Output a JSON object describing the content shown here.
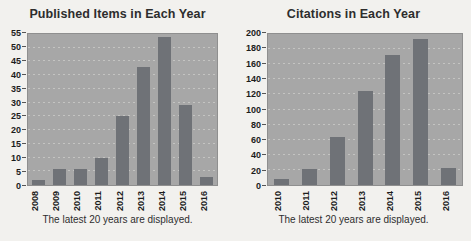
{
  "page": {
    "background_color": "#f2f1ee"
  },
  "chart_data": [
    {
      "type": "bar",
      "title": "Published Items in Each Year",
      "categories": [
        "2008",
        "2009",
        "2010",
        "2011",
        "2012",
        "2013",
        "2014",
        "2015",
        "2016"
      ],
      "values": [
        2,
        6,
        6,
        10,
        25,
        43,
        54,
        29,
        3
      ],
      "xlabel": "",
      "ylabel": "",
      "ylim": [
        0,
        55
      ],
      "ytick_step": 5,
      "grid": "horizontal-dashed",
      "legend": "none",
      "xlabel_rotation": "vertical",
      "footnote": "The latest 20 years are displayed.",
      "bar_color": "#6f7277",
      "plot_bg": "#a7a7a7"
    },
    {
      "type": "bar",
      "title": "Citations in Each Year",
      "categories": [
        "2010",
        "2011",
        "2012",
        "2013",
        "2014",
        "2015",
        "2016"
      ],
      "values": [
        8,
        21,
        64,
        125,
        172,
        194,
        23
      ],
      "xlabel": "",
      "ylabel": "",
      "ylim": [
        0,
        200
      ],
      "ytick_step": 20,
      "grid": "horizontal-dashed",
      "legend": "none",
      "xlabel_rotation": "vertical",
      "footnote": "The latest 20 years are displayed.",
      "bar_color": "#6f7277",
      "plot_bg": "#a7a7a7"
    }
  ]
}
